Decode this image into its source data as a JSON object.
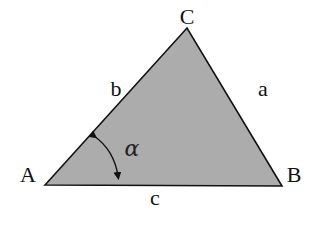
{
  "diagram": {
    "colors": {
      "fill": "#acacac",
      "stroke": "#111111",
      "text": "#111111",
      "background": "#ffffff"
    },
    "vertices": [
      {
        "id": "A",
        "label": "A",
        "x": 45,
        "y": 185
      },
      {
        "id": "B",
        "label": "B",
        "x": 282,
        "y": 186
      },
      {
        "id": "C",
        "label": "C",
        "x": 187,
        "y": 28
      }
    ],
    "sides": [
      {
        "id": "a",
        "label": "a",
        "from": "B",
        "to": "C"
      },
      {
        "id": "b",
        "label": "b",
        "from": "A",
        "to": "C"
      },
      {
        "id": "c",
        "label": "c",
        "from": "A",
        "to": "B"
      }
    ],
    "angle": {
      "vertex": "A",
      "label": "α",
      "symbol_name": "alpha",
      "arrows": "both-ends"
    }
  }
}
